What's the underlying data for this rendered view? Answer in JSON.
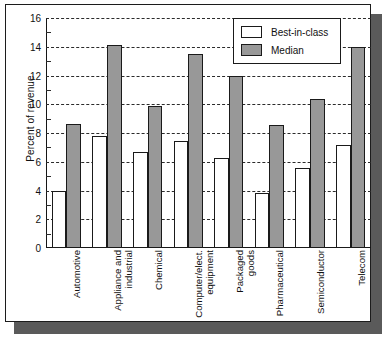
{
  "chart_data": {
    "type": "bar",
    "title": "",
    "xlabel": "",
    "ylabel": "Percent of revenue",
    "ylim": [
      0,
      16
    ],
    "ytick_values": [
      0,
      2,
      4,
      6,
      8,
      10,
      12,
      14,
      16
    ],
    "ytick_labels": [
      "0",
      "2",
      "4",
      "6",
      "8",
      "10",
      "12",
      "14",
      "16"
    ],
    "ytick_step": 2,
    "grid": "horizontal-dashed",
    "legend_position": "top-right",
    "categories": [
      "Automotive",
      "Appliance and\nindustrial",
      "Chemical",
      "Computer/elect.\nequipment",
      "Packaged\ngoods",
      "Pharmaceutical",
      "Semiconductor",
      "Telecom"
    ],
    "series": [
      {
        "name": "Best-in-class",
        "color": "#ffffff",
        "values": [
          4.0,
          7.8,
          6.65,
          7.45,
          6.25,
          3.8,
          5.55,
          7.15
        ]
      },
      {
        "name": "Median",
        "color": "#989898",
        "values": [
          8.6,
          14.1,
          9.85,
          13.5,
          12.0,
          8.55,
          10.35,
          14.0
        ]
      }
    ]
  },
  "legend": {
    "entries": [
      {
        "label": "Best-in-class",
        "swatch": "white"
      },
      {
        "label": "Median",
        "swatch": "gray"
      }
    ]
  },
  "colors": {
    "bar_best_in_class": "#ffffff",
    "bar_median": "#989898",
    "axis": "#161616",
    "grid": "#2b2b2b",
    "panel_background": "#ffffff",
    "shadow": "#5a5a5a"
  }
}
